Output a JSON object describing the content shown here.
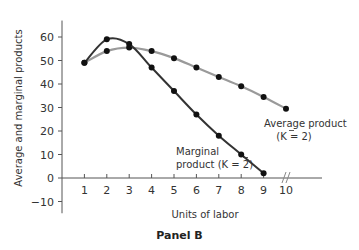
{
  "panel_title": "Panel B",
  "chart_data": {
    "type": "line",
    "title": "Panel B",
    "xlabel": "Units of labor",
    "ylabel": "Average and marginal products",
    "x_ticks": [
      1,
      2,
      3,
      4,
      5,
      6,
      7,
      8,
      9,
      10
    ],
    "y_ticks": [
      -10,
      0,
      10,
      20,
      30,
      40,
      50,
      60
    ],
    "xlim": [
      0,
      10.5
    ],
    "ylim": [
      -15,
      67
    ],
    "grid": false,
    "legend": "none (inline annotations)",
    "x_axis_break_at": 10,
    "series": [
      {
        "name": "Average product (K̄ = 2)",
        "color": "#9a9a9a",
        "x": [
          1,
          2,
          3,
          4,
          5,
          6,
          7,
          8,
          9,
          10
        ],
        "values": [
          49,
          54,
          55.5,
          54,
          51,
          47,
          43,
          39,
          34.5,
          29.5
        ]
      },
      {
        "name": "Marginal product (K̄ = 2)",
        "color": "#333333",
        "x": [
          1,
          2,
          3,
          4,
          5,
          6,
          7,
          8,
          9
        ],
        "values": [
          49,
          59,
          57,
          47,
          37,
          27,
          18,
          10,
          2
        ]
      }
    ],
    "annotations": [
      {
        "text": "Average product",
        "sub": "(K̄ = 2)",
        "near": "AP curve end at x=10"
      },
      {
        "text": "Marginal",
        "sub": "product (K̄ = 2)",
        "near": "MP curve near x=7-8"
      }
    ]
  },
  "labels": {
    "ap_line1": "Average product",
    "ap_line2": "(K = 2)",
    "mp_line1": "Marginal",
    "mp_line2": "product (K = 2)",
    "xlabel": "Units of labor",
    "ylabel": "Average and marginal products"
  }
}
